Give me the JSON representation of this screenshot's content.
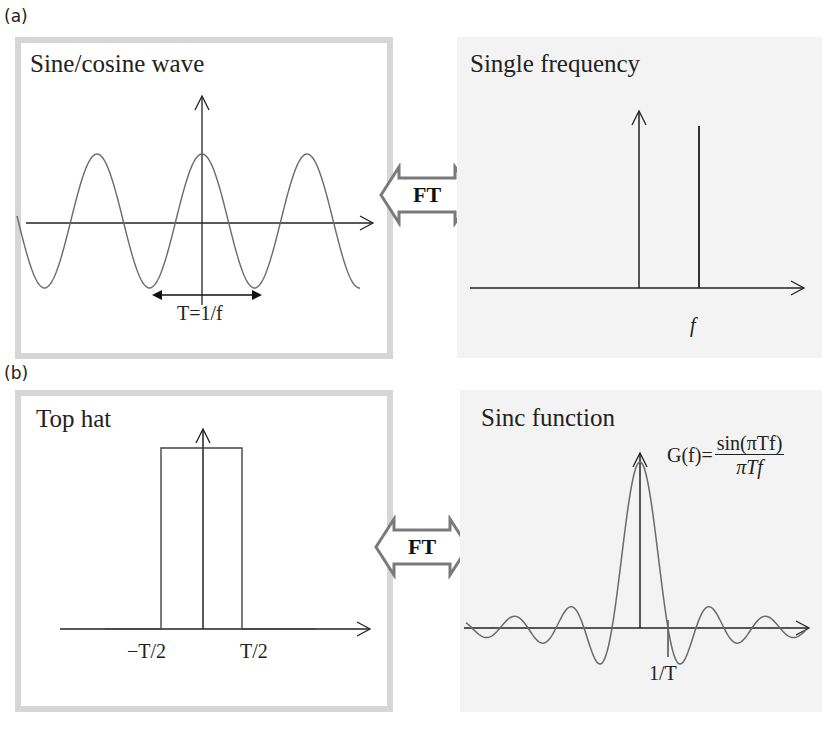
{
  "figure": {
    "sections": [
      {
        "label": "(a)",
        "left_panel": {
          "title": "Sine/cosine wave",
          "annotation": "T=1/f",
          "curve": "cosine",
          "period_px": 105
        },
        "transform_label": "FT",
        "right_panel": {
          "title": "Single frequency",
          "x_label": "f",
          "features": [
            "vertical axis arrow at origin",
            "single spike at frequency f"
          ]
        }
      },
      {
        "label": "(b)",
        "left_panel": {
          "title": "Top hat",
          "tick_left": "−T/2",
          "tick_right": "T/2",
          "curve": "rectangular pulse"
        },
        "transform_label": "FT",
        "right_panel": {
          "title": "Sinc function",
          "formula_lhs": "G(f)=",
          "formula_num": "sin(πTf)",
          "formula_den": "πTf",
          "tick_label": "1/T",
          "curve": "sinc"
        }
      }
    ],
    "colors": {
      "panel_border": "#d6d6d6",
      "right_panel_bg": "#f3f3f3",
      "curve": "#6a6a6a",
      "axis": "#222222",
      "ft_arrow_stroke": "#7a7a7a"
    },
    "icons": {
      "ft_arrow": "double-headed-hollow-arrow-icon",
      "axis_arrow": "arrowhead-icon"
    }
  }
}
